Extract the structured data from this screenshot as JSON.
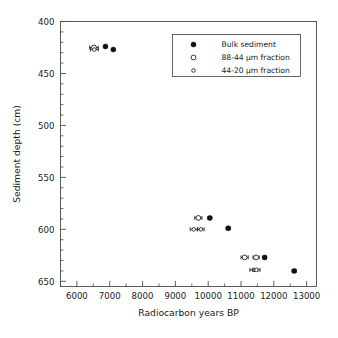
{
  "figure": {
    "cropped_header_text": "",
    "background_color": "#ffffff",
    "foreground_color": "#1a1a1a"
  },
  "axes": {
    "x_title": "Radiocarbon years BP",
    "y_title": "Sediment depth (cm)",
    "x_ticks": [
      "6000",
      "7000",
      "8000",
      "9000",
      "10000",
      "11000",
      "12000",
      "13000"
    ],
    "y_ticks": [
      "400",
      "450",
      "500",
      "550",
      "600",
      "650"
    ]
  },
  "legend": {
    "entries": [
      {
        "label": "Bulk sediment",
        "marker": "filled-circle",
        "color": "#101010"
      },
      {
        "label": "88-44 µm fraction",
        "marker": "open-circle-large",
        "color": "#101010"
      },
      {
        "label": "44-20 µm fraction",
        "marker": "open-circle-small",
        "color": "#101010"
      }
    ]
  },
  "chart_data": {
    "type": "scatter",
    "title": "",
    "xlabel": "Radiocarbon years BP",
    "ylabel": "Sediment depth (cm)",
    "xlim": [
      5500,
      13300
    ],
    "ylim": [
      400,
      655
    ],
    "y_inverted": true,
    "grid": false,
    "legend_position": "upper-right",
    "x_tick_values": [
      6000,
      7000,
      8000,
      9000,
      10000,
      11000,
      12000,
      13000
    ],
    "y_tick_values": [
      400,
      450,
      500,
      550,
      600,
      650
    ],
    "x_minor_tick_step": 500,
    "y_minor_tick_step": 10,
    "series": [
      {
        "name": "Bulk sediment",
        "marker": "filled-circle",
        "points": [
          {
            "x": 6870,
            "y": 424,
            "xerr": 0
          },
          {
            "x": 7110,
            "y": 427,
            "xerr": 0
          },
          {
            "x": 10050,
            "y": 589,
            "xerr": 55
          },
          {
            "x": 10610,
            "y": 599,
            "xerr": 60
          },
          {
            "x": 11720,
            "y": 627,
            "xerr": 55
          },
          {
            "x": 12620,
            "y": 640,
            "xerr": 60
          }
        ]
      },
      {
        "name": "88-44 µm fraction",
        "marker": "open-circle-large",
        "points": [
          {
            "x": 6520,
            "y": 425,
            "xerr": 130
          },
          {
            "x": 9700,
            "y": 589,
            "xerr": 110
          },
          {
            "x": 11110,
            "y": 627,
            "xerr": 110
          },
          {
            "x": 11460,
            "y": 627,
            "xerr": 95
          }
        ]
      },
      {
        "name": "44-20 µm fraction",
        "marker": "open-circle-small",
        "points": [
          {
            "x": 6530,
            "y": 427,
            "xerr": 120
          },
          {
            "x": 9560,
            "y": 600,
            "xerr": 110
          },
          {
            "x": 9780,
            "y": 600,
            "xerr": 95
          },
          {
            "x": 11390,
            "y": 639,
            "xerr": 120
          },
          {
            "x": 11470,
            "y": 639,
            "xerr": 110
          }
        ]
      }
    ]
  }
}
